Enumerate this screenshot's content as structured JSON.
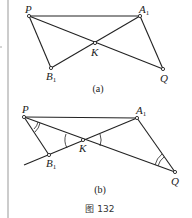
{
  "figure": {
    "caption": "图 132",
    "panels": [
      {
        "id": "a",
        "caption": "(a)",
        "points": {
          "P": {
            "label": "P",
            "x": 29,
            "y": 16
          },
          "A1": {
            "label": "A",
            "sub": "1",
            "x": 140,
            "y": 16
          },
          "K": {
            "label": "K",
            "x": 95,
            "y": 43
          },
          "B1": {
            "label": "B",
            "sub": "1",
            "x": 51,
            "y": 68
          },
          "Q": {
            "label": "Q",
            "x": 163,
            "y": 69
          }
        },
        "segments": [
          [
            "P",
            "A1"
          ],
          [
            "P",
            "Q"
          ],
          [
            "A1",
            "B1"
          ],
          [
            "P",
            "B1"
          ],
          [
            "A1",
            "Q"
          ]
        ]
      },
      {
        "id": "b",
        "caption": "(b)",
        "points": {
          "P": {
            "label": "P",
            "x": 24,
            "y": 117
          },
          "A1": {
            "label": "A",
            "sub": "1",
            "x": 137,
            "y": 118
          },
          "K": {
            "label": "K",
            "x": 83,
            "y": 140
          },
          "B1": {
            "label": "B",
            "sub": "1",
            "x": 49,
            "y": 155
          },
          "Q": {
            "label": "Q",
            "x": 175,
            "y": 172
          }
        },
        "segments": [
          [
            "P",
            "A1"
          ],
          [
            "P",
            "Q"
          ],
          [
            "A1",
            "B1ext"
          ],
          [
            "P",
            "B1"
          ],
          [
            "A1",
            "Q"
          ]
        ],
        "angle_marks": [
          "P (double arc)",
          "K (single arcs, vertical angles)",
          "Q (double arc)"
        ]
      }
    ]
  }
}
